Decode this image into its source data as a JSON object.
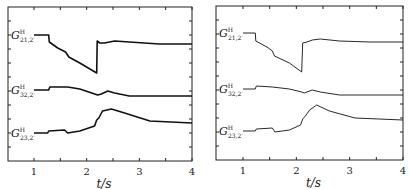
{
  "chart_data": [
    {
      "type": "line",
      "title": "",
      "xlabel": "t/s",
      "ylabel": "",
      "xlim": [
        0.5,
        4
      ],
      "xticks": [
        1,
        2,
        3,
        4
      ],
      "grid": false,
      "line_width": "thick",
      "series": [
        {
          "name": "G^H_{21,2'}",
          "label_main": "G",
          "label_sup": "H",
          "label_sub": "21,2′",
          "points": [
            [
              1.0,
              35
            ],
            [
              1.28,
              35
            ],
            [
              1.29,
              42
            ],
            [
              1.45,
              48
            ],
            [
              1.6,
              52
            ],
            [
              1.66,
              57
            ],
            [
              1.87,
              63
            ],
            [
              2.19,
              73
            ],
            [
              2.2,
              41
            ],
            [
              2.25,
              43
            ],
            [
              2.34,
              43
            ],
            [
              2.53,
              41
            ],
            [
              2.81,
              42
            ],
            [
              3.38,
              44
            ],
            [
              4.0,
              44
            ]
          ]
        },
        {
          "name": "G^H_{32,2'}",
          "label_main": "G",
          "label_sup": "H",
          "label_sub": "32,2′",
          "points": [
            [
              1.0,
              90
            ],
            [
              1.28,
              90
            ],
            [
              1.3,
              87
            ],
            [
              1.64,
              87
            ],
            [
              1.87,
              89
            ],
            [
              2.21,
              95
            ],
            [
              2.28,
              94
            ],
            [
              2.4,
              91
            ],
            [
              2.53,
              93
            ],
            [
              2.81,
              96
            ],
            [
              3.38,
              96
            ],
            [
              4.0,
              96
            ]
          ]
        },
        {
          "name": "G^H_{23,2'}",
          "label_main": "G",
          "label_sup": "H",
          "label_sub": "23,2′",
          "points": [
            [
              1.0,
              133
            ],
            [
              1.26,
              133
            ],
            [
              1.28,
              131
            ],
            [
              1.58,
              130
            ],
            [
              1.64,
              133
            ],
            [
              1.87,
              131
            ],
            [
              2.15,
              126
            ],
            [
              2.19,
              120
            ],
            [
              2.23,
              118
            ],
            [
              2.3,
              111
            ],
            [
              2.47,
              109
            ],
            [
              2.72,
              113
            ],
            [
              3.2,
              121
            ],
            [
              4.0,
              123
            ]
          ]
        }
      ]
    },
    {
      "type": "line",
      "title": "",
      "xlabel": "t/s",
      "ylabel": "",
      "xlim": [
        0.5,
        4
      ],
      "xticks": [
        1,
        2,
        3,
        4
      ],
      "grid": false,
      "line_width": "thin",
      "series": [
        {
          "name": "G^H_{21,2'}",
          "label_main": "G",
          "label_sup": "H",
          "label_sub": "21,2′",
          "points": [
            [
              1.0,
              34
            ],
            [
              1.23,
              34
            ],
            [
              1.24,
              42
            ],
            [
              1.45,
              48
            ],
            [
              1.55,
              52
            ],
            [
              1.59,
              57
            ],
            [
              1.87,
              64
            ],
            [
              2.1,
              73
            ],
            [
              2.12,
              44
            ],
            [
              2.2,
              43
            ],
            [
              2.3,
              41
            ],
            [
              2.45,
              40
            ],
            [
              2.81,
              42
            ],
            [
              3.38,
              43
            ],
            [
              4.0,
              43
            ]
          ]
        },
        {
          "name": "G^H_{32,2'}",
          "label_main": "G",
          "label_sup": "H",
          "label_sub": "32,2′",
          "points": [
            [
              1.0,
              90
            ],
            [
              1.23,
              90
            ],
            [
              1.25,
              87
            ],
            [
              1.55,
              88
            ],
            [
              1.87,
              90
            ],
            [
              2.1,
              93
            ],
            [
              2.15,
              94
            ],
            [
              2.3,
              91
            ],
            [
              2.45,
              93
            ],
            [
              2.81,
              96
            ],
            [
              3.38,
              96
            ],
            [
              4.0,
              96
            ]
          ]
        },
        {
          "name": "G^H_{23,2'}",
          "label_main": "G",
          "label_sup": "H",
          "label_sub": "23,2′",
          "points": [
            [
              1.0,
              132
            ],
            [
              1.23,
              132
            ],
            [
              1.25,
              130
            ],
            [
              1.55,
              129
            ],
            [
              1.6,
              133
            ],
            [
              1.87,
              131
            ],
            [
              2.08,
              126
            ],
            [
              2.12,
              120
            ],
            [
              2.17,
              117
            ],
            [
              2.25,
              111
            ],
            [
              2.38,
              106
            ],
            [
              2.62,
              112
            ],
            [
              3.1,
              119
            ],
            [
              4.0,
              121
            ]
          ]
        }
      ]
    }
  ],
  "panels": [
    {
      "xlabel": "t/s",
      "tick_labels": [
        "1",
        "2",
        "3",
        "4"
      ]
    },
    {
      "xlabel": "t/s",
      "tick_labels": [
        "1",
        "2",
        "3",
        "4"
      ]
    }
  ]
}
